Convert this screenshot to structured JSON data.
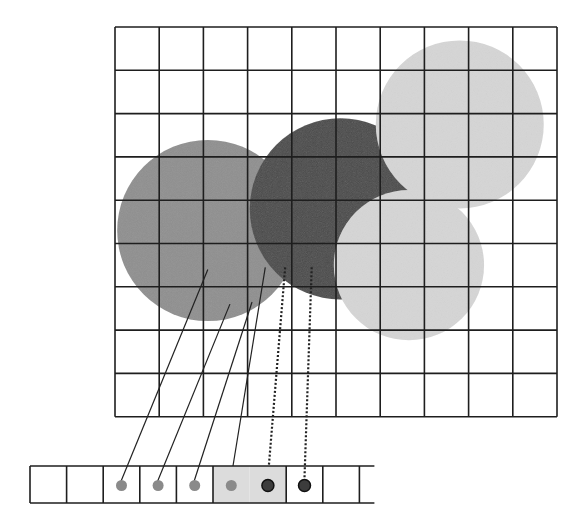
{
  "diagram": {
    "grid": {
      "columns": 10,
      "rows": 9
    },
    "colors": {
      "grid_line": "#1e1e1e",
      "circle_medium": "#8f8f8f",
      "circle_dark": "#4a4a4a",
      "circle_light": "#d6d6d6",
      "strip_highlight": "#dcdcdc",
      "dot_medium": "#8a8a8a",
      "dot_dark": "#3c3c3c"
    },
    "circles": [
      {
        "name": "medium-gray-circle",
        "shade": "medium",
        "cx": 2.1,
        "cy": 4.7,
        "r": 2.05
      },
      {
        "name": "dark-gray-circle",
        "shade": "dark",
        "cx": 5.1,
        "cy": 4.2,
        "r": 2.05
      },
      {
        "name": "light-gray-circle-upper",
        "shade": "light",
        "cx": 7.8,
        "cy": 2.25,
        "r": 1.9
      },
      {
        "name": "light-gray-circle-lower",
        "shade": "light",
        "cx": 6.65,
        "cy": 5.5,
        "r": 1.7
      }
    ],
    "strip": {
      "cells": [
        {
          "dot": null,
          "highlight": false
        },
        {
          "dot": null,
          "highlight": false
        },
        {
          "dot": "medium",
          "highlight": false
        },
        {
          "dot": "medium",
          "highlight": false
        },
        {
          "dot": "medium",
          "highlight": false
        },
        {
          "dot": "medium",
          "highlight": true,
          "merged_with_next": true
        },
        {
          "dot": "dark",
          "highlight": true
        },
        {
          "dot": "dark",
          "highlight": false
        },
        {
          "dot": null,
          "highlight": false
        }
      ],
      "open_right": true
    },
    "samples": [
      {
        "from": [
          2.1,
          5.6
        ],
        "to_cell": 2,
        "style": "solid"
      },
      {
        "from": [
          2.6,
          6.4
        ],
        "to_cell": 3,
        "style": "solid"
      },
      {
        "from": [
          3.1,
          6.35
        ],
        "to_cell": 4,
        "style": "solid"
      },
      {
        "from": [
          3.4,
          5.55
        ],
        "to_cell": 5,
        "style": "solid"
      },
      {
        "from": [
          3.85,
          5.55
        ],
        "to_cell": 6,
        "style": "dotted"
      },
      {
        "from": [
          4.45,
          5.55
        ],
        "to_cell": 7,
        "style": "dotted"
      }
    ]
  }
}
